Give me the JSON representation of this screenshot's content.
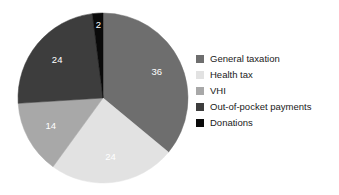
{
  "chart_data": {
    "type": "pie",
    "title": "",
    "labels": [
      "General taxation",
      "Health tax",
      "VHI",
      "Out-of-pocket payments",
      "Donations"
    ],
    "values": [
      36,
      24,
      14,
      24,
      2
    ],
    "value_labels": [
      "36",
      "24",
      "14",
      "24",
      "2"
    ],
    "colors": [
      "#6e6e6e",
      "#e2e2e2",
      "#a8a8a8",
      "#3d3d3d",
      "#0a0a0a"
    ],
    "label_text_color": "#ffffff",
    "start_angle_deg": 0,
    "direction": "clockwise",
    "legend_position": "right",
    "grid": false,
    "units": "percent",
    "background": "#ffffff"
  },
  "legend": {
    "items": [
      {
        "label": "General taxation",
        "color": "#6e6e6e"
      },
      {
        "label": "Health tax",
        "color": "#e2e2e2"
      },
      {
        "label": "VHI",
        "color": "#a8a8a8"
      },
      {
        "label": "Out-of-pocket payments",
        "color": "#3d3d3d"
      },
      {
        "label": "Donations",
        "color": "#0a0a0a"
      }
    ]
  }
}
